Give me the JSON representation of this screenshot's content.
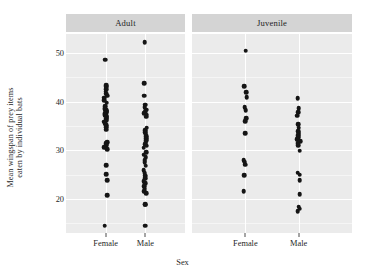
{
  "chart_data": {
    "type": "scatter",
    "title": "",
    "xlabel": "Sex",
    "ylabel": "Mean wingspan of prey items eaten by individual bats",
    "ylabel_line1": "Mean wingspan of prey items",
    "ylabel_line2": "eaten by individual bats",
    "ylim": [
      13,
      54
    ],
    "yticks": [
      20,
      30,
      40,
      50
    ],
    "ytick_labels": [
      "20",
      "30",
      "40",
      "50"
    ],
    "yminor": [
      15,
      25,
      35,
      45
    ],
    "grid": true,
    "legend": "none",
    "facet_variable": "Age class",
    "facets": [
      {
        "label": "Adult",
        "categories": [
          "Female",
          "Male"
        ],
        "groups": [
          {
            "name": "Female",
            "n": 38,
            "values": [
              48.6,
              43.4,
              43.1,
              42.6,
              42.0,
              41.6,
              41.2,
              40.8,
              40.3,
              39.8,
              39.0,
              38.6,
              38.4,
              38.2,
              38.0,
              37.8,
              37.6,
              37.4,
              37.2,
              37.0,
              36.8,
              36.5,
              36.2,
              35.9,
              35.5,
              35.1,
              34.7,
              34.2,
              31.7,
              31.4,
              31.0,
              30.6,
              30.2,
              26.9,
              25.1,
              23.9,
              20.8,
              14.5
            ]
          },
          {
            "name": "Male",
            "n": 40,
            "values": [
              52.2,
              43.8,
              41.2,
              39.4,
              38.8,
              38.3,
              37.9,
              37.6,
              37.3,
              36.9,
              34.6,
              34.1,
              33.7,
              33.3,
              32.9,
              32.5,
              32.1,
              31.7,
              31.3,
              30.9,
              30.5,
              29.6,
              29.1,
              28.6,
              28.0,
              27.5,
              26.8,
              25.9,
              25.3,
              24.8,
              24.3,
              23.7,
              23.2,
              22.6,
              22.1,
              21.6,
              21.2,
              18.9,
              18.8,
              14.5
            ]
          }
        ]
      },
      {
        "label": "Juvenile",
        "categories": [
          "Female",
          "Male"
        ],
        "groups": [
          {
            "name": "Female",
            "n": 14,
            "values": [
              50.5,
              43.2,
              41.9,
              40.9,
              38.9,
              38.2,
              36.6,
              36.0,
              33.5,
              27.9,
              27.5,
              27.0,
              24.9,
              21.6
            ]
          },
          {
            "name": "Male",
            "n": 22,
            "values": [
              40.7,
              38.6,
              37.8,
              37.1,
              35.4,
              34.6,
              33.9,
              33.5,
              33.1,
              32.7,
              32.3,
              31.9,
              31.5,
              31.1,
              29.9,
              25.4,
              25.0,
              23.9,
              21.0,
              18.4,
              18.0,
              17.5
            ]
          }
        ]
      }
    ]
  },
  "axis": {
    "xlabel": "Sex",
    "ylabel_line1": "Mean wingspan of prey items",
    "ylabel_line2": "eaten by individual bats"
  },
  "colors": {
    "panel_background": "#ebebeb",
    "strip_background": "#d4d4d4",
    "gridline_major": "#ffffff",
    "gridline_minor": "#f5f5f5",
    "point": "#151515",
    "text": "#1f1f1f",
    "figure_background": "#ffffff"
  }
}
